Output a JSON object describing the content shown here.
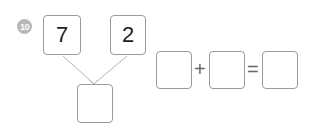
{
  "problem": {
    "number": "10",
    "top_left_value": "7",
    "top_right_value": "2",
    "bottom_value": "",
    "equation": {
      "first": "",
      "operator": "+",
      "second": "",
      "equals": "=",
      "result": ""
    }
  },
  "colors": {
    "badge": "#b8b8b8",
    "box_border": "#9a9a9a",
    "line": "#b0b0b0"
  }
}
